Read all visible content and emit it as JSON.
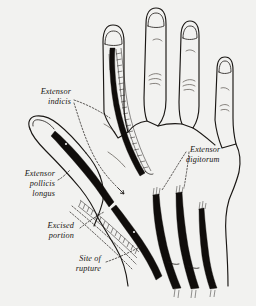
{
  "figure": {
    "kind": "anatomical-line-drawing",
    "background_color": "#f2f2f0",
    "ink_color": "#171412"
  },
  "labels": {
    "extensor_indicis": {
      "line1": "Extensor",
      "line2": "indicis"
    },
    "extensor_pollicis_longus": {
      "line1": "Extensor",
      "line2": "pollicis",
      "line3": "longus"
    },
    "excised_portion": {
      "line1": "Excised",
      "line2": "portion"
    },
    "site_of_rupture": {
      "line1": "Site of",
      "line2": "rupture"
    },
    "extensor_digitorum": {
      "line1": "Extensor",
      "line2": "digitorum"
    }
  },
  "structures": [
    {
      "name": "index-finger",
      "has_tendon_graft": true
    },
    {
      "name": "middle-finger",
      "has_tendon_graft": false
    },
    {
      "name": "ring-finger",
      "has_tendon_graft": false
    },
    {
      "name": "little-finger",
      "has_tendon_graft": false
    },
    {
      "name": "thumb",
      "has_tendon_graft": true
    },
    {
      "name": "extensor-digitorum-tendon-group",
      "count": 3
    }
  ]
}
